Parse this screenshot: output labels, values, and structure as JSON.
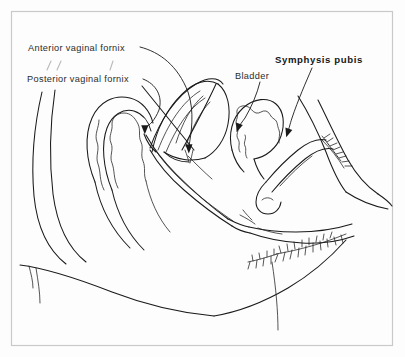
{
  "figure": {
    "frame_color": "#c9c9c9",
    "ink_color": "#1a1a1a",
    "background_color": "#fdfdfd"
  },
  "labels": [
    {
      "id": "anterior-vaginal-fornix",
      "text": "Anterior vaginal fornix",
      "weight": "regular",
      "x": 28,
      "y": 44
    },
    {
      "id": "posterior-vaginal-fornix",
      "text": "Posterior vaginal fornix",
      "weight": "regular",
      "x": 27,
      "y": 75
    },
    {
      "id": "bladder",
      "text": "Bladder",
      "weight": "regular",
      "x": 235,
      "y": 72
    },
    {
      "id": "symphysis-pubis",
      "text": "Symphysis pubis",
      "weight": "bold",
      "x": 275,
      "y": 55
    }
  ],
  "leaders": [
    {
      "id": "leader-anterior-vaginal-fornix",
      "from_label": "anterior-vaginal-fornix",
      "arrow_tip": [
        188,
        152
      ]
    },
    {
      "id": "leader-posterior-vaginal-fornix",
      "from_label": "posterior-vaginal-fornix",
      "arrow_tip": [
        145,
        133
      ]
    },
    {
      "id": "leader-bladder",
      "from_label": "bladder",
      "arrow_tip": [
        237,
        131
      ]
    },
    {
      "id": "leader-symphysis-pubis",
      "from_label": "symphysis-pubis",
      "arrow_tip": [
        287,
        136
      ]
    }
  ],
  "anatomy_parts": [
    "sacrum-contour",
    "rectum",
    "uterus",
    "fallopian-tube",
    "bladder-organ",
    "vagina",
    "symphysis-pubis-bone",
    "labia",
    "pubic-hair",
    "buttock-contour",
    "abdominal-wall"
  ]
}
